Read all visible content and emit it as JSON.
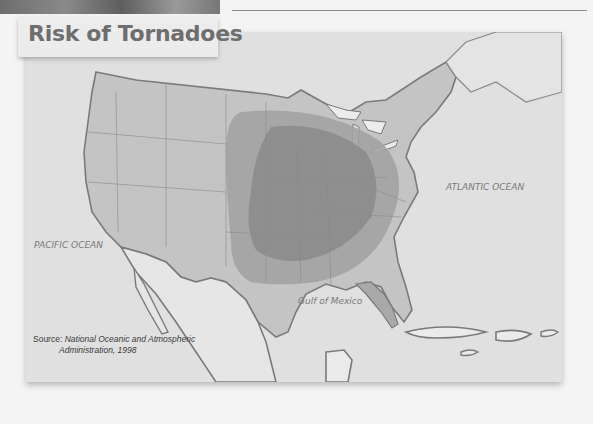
{
  "title": "Risk of Tornadoes",
  "labels": {
    "atlantic": "ATLANTIC OCEAN",
    "pacific": "PACIFIC OCEAN",
    "gulf": "Gulf of Mexico"
  },
  "source": {
    "label": "Source:",
    "line1": "National Oceanic and Atmospheric",
    "line2": "Administration, 1998"
  },
  "legend_zones": [
    {
      "name": "highest-risk",
      "color": "#8c8c8c"
    },
    {
      "name": "high-risk",
      "color": "#a3a3a3"
    },
    {
      "name": "land",
      "color": "#c4c4c4"
    },
    {
      "name": "water",
      "color": "#e2e2e2"
    }
  ]
}
